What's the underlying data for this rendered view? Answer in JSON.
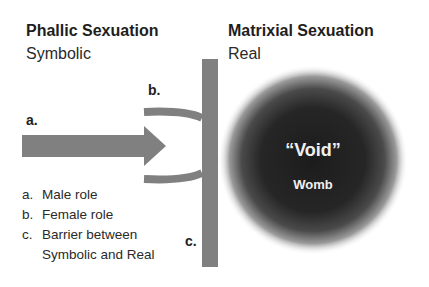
{
  "left": {
    "title": "Phallic Sexuation",
    "subtitle": "Symbolic"
  },
  "right": {
    "title": "Matrixial Sexuation",
    "subtitle": "Real"
  },
  "labels": {
    "a": "a.",
    "b": "b.",
    "c": "c."
  },
  "void": {
    "title": "“Void”",
    "subtitle": "Womb"
  },
  "legend": {
    "items": [
      {
        "key": "a.",
        "text": "Male role"
      },
      {
        "key": "b.",
        "text": "Female role"
      },
      {
        "key": "c.",
        "text": "Barrier between"
      },
      {
        "key": "",
        "text": "Symbolic and Real"
      }
    ]
  },
  "colors": {
    "shape_gray": "#808080",
    "void_dark": "#1c1c1c",
    "text": "#1e1e1e"
  }
}
